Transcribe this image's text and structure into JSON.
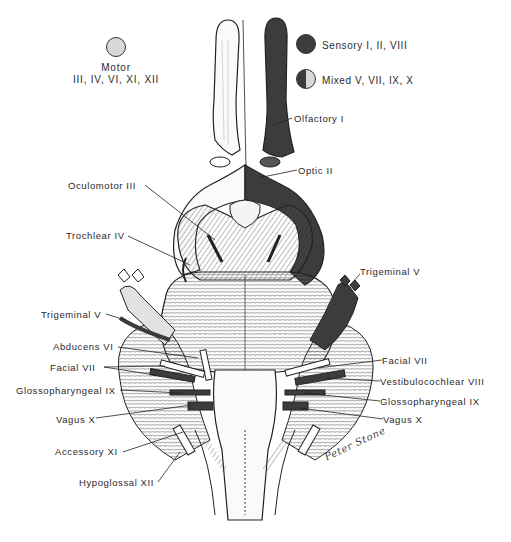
{
  "figure": {
    "colors": {
      "sensory": "#3c3c3c",
      "motor": "#d8d8d8",
      "line": "#222222",
      "background": "#ffffff"
    }
  },
  "legend": {
    "motor": {
      "title": "Motor",
      "nerves": "III, IV, VI, XI, XII"
    },
    "sensory": {
      "label": "Sensory I, II, VIII"
    },
    "mixed": {
      "label": "Mixed V, VII, IX, X"
    }
  },
  "labels": {
    "left": [
      {
        "text": "Oculomotor III"
      },
      {
        "text": "Trochlear IV"
      },
      {
        "text": "Trigeminal V"
      },
      {
        "text": "Abducens VI"
      },
      {
        "text": "Facial VII"
      },
      {
        "text": "Glossopharyngeal IX"
      },
      {
        "text": "Vagus X"
      },
      {
        "text": "Accessory XI"
      },
      {
        "text": "Hypoglossal XII"
      }
    ],
    "right": [
      {
        "text": "Olfactory I"
      },
      {
        "text": "Optic II"
      },
      {
        "text": "Trigeminal V"
      },
      {
        "text": "Facial VII"
      },
      {
        "text": "Vestibulocochlear VIII"
      },
      {
        "text": "Glossopharyngeal IX"
      },
      {
        "text": "Vagus X"
      }
    ]
  },
  "signature": "Peter Stone"
}
